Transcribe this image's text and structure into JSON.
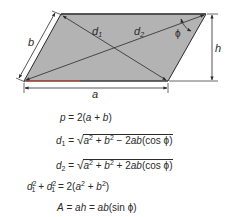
{
  "diagram": {
    "shape_fill": "#b3b3b3",
    "stroke_color": "#2a2a2a",
    "accent_line_color": "#c0392b",
    "labels": {
      "side_a": "a",
      "side_b": "b",
      "height": "h",
      "diagonal_1": "d",
      "diagonal_1_sub": "1",
      "diagonal_2": "d",
      "diagonal_2_sub": "2",
      "angle": "ϕ"
    },
    "vertices": {
      "bottom_left": [
        24,
        81
      ],
      "top_left": [
        61,
        14
      ],
      "top_right": [
        206,
        14
      ],
      "bottom_right": [
        168,
        81
      ]
    }
  },
  "formulas": [
    {
      "id": "perimeter",
      "text": "p = 2(a + b)"
    },
    {
      "id": "diagonal_1",
      "text": "d1 = √(a² + b² − 2ab(cos ϕ))"
    },
    {
      "id": "diagonal_2",
      "text": "d2 = √(a² + b² + 2ab(cos ϕ))"
    },
    {
      "id": "diagonal_sum",
      "text": "d1² + d1² = 2(a² + b²)"
    },
    {
      "id": "area",
      "text": "A = ah = ab(sin ϕ)"
    }
  ]
}
